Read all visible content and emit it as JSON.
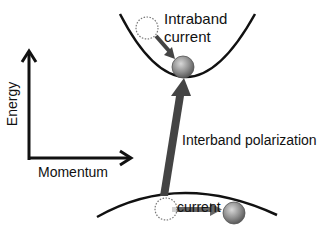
{
  "labels": {
    "intraband": "Intraband",
    "intraband2": "current",
    "interband": "Interband polarization",
    "lower_current": "current",
    "energy_axis": "Energy",
    "momentum_axis": "Momentum"
  },
  "colors": {
    "curve": "#111111",
    "arrow": "#555555",
    "ball": "#8a8a8a",
    "hole_outline": "#777777"
  }
}
